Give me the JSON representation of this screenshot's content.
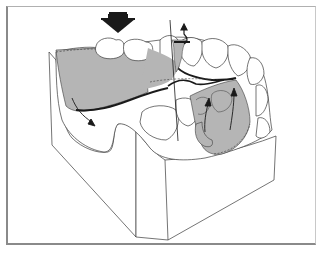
{
  "figure": {
    "colors": {
      "background": "#ffffff",
      "frame": "#8a8a8a",
      "denture_base_fill": "#b5b5b5",
      "major_connector_stroke": "#1a1a1a",
      "outline": "#3a3a3a",
      "arrow": "#1a1a1a"
    },
    "elements": {
      "occlusal_force_arrow": "large downward block arrow above posterior teeth",
      "fulcrum_line": "vertical axis line through rest on abutment",
      "rest_lift_arrow": "small upward curved arrow at occlusal rest",
      "denture_base_left": "gray saddle over edentulous ridge",
      "denture_base_right": "gray saddle with indirect retainer",
      "displacement_arrow": "downward arrow from left saddle",
      "rotation_arrows": "two upward arrows on right saddle"
    }
  }
}
